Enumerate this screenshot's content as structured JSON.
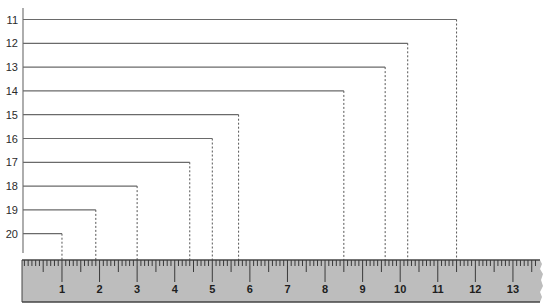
{
  "diagram": {
    "rows": [
      {
        "label": "11",
        "end_value": 11.5
      },
      {
        "label": "12",
        "end_value": 10.2
      },
      {
        "label": "13",
        "end_value": 9.6
      },
      {
        "label": "14",
        "end_value": 8.5
      },
      {
        "label": "15",
        "end_value": 5.7
      },
      {
        "label": "16",
        "end_value": 5.0
      },
      {
        "label": "17",
        "end_value": 4.4
      },
      {
        "label": "18",
        "end_value": 3.0
      },
      {
        "label": "19",
        "end_value": 1.9
      },
      {
        "label": "20",
        "end_value": 1.0
      }
    ],
    "ruler": {
      "labels": [
        "1",
        "2",
        "3",
        "4",
        "5",
        "6",
        "7",
        "8",
        "9",
        "10",
        "11",
        "12",
        "13"
      ],
      "divisions_per_unit": 10,
      "half_mark": true
    },
    "colors": {
      "line": "#6a6a6a",
      "dash": "#555555",
      "axis": "#777777",
      "ruler_fill": "#bdbdbd",
      "ruler_edge": "#454545",
      "tick": "#3a3a3a"
    }
  }
}
